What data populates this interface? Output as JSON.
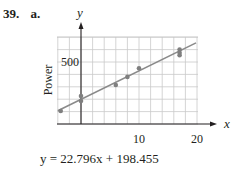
{
  "problem": {
    "number": "39.",
    "part": "a."
  },
  "equation": {
    "text": "y = 22.796x + 198.455"
  },
  "colors": {
    "grid": "#c9c9c9",
    "axis": "#231f20",
    "line": "#8a8a8a",
    "point": "#7f7f7f"
  },
  "chart_data": {
    "type": "scatter",
    "title": "",
    "xlabel": "Force",
    "ylabel": "Power",
    "x_axis_symbol": "x",
    "y_axis_symbol": "y",
    "x_ticks": [
      10,
      20
    ],
    "x_tick_labels": [
      "10",
      "20"
    ],
    "y_ticks": [
      500
    ],
    "y_tick_labels": [
      "500"
    ],
    "xlim": [
      -4,
      20
    ],
    "ylim": [
      0,
      700
    ],
    "grid": true,
    "grid_x_step": 2,
    "grid_y_step": 100,
    "points": [
      {
        "x": -3.5,
        "y": 105
      },
      {
        "x": 0,
        "y": 225
      },
      {
        "x": 0,
        "y": 185
      },
      {
        "x": 6,
        "y": 315
      },
      {
        "x": 8,
        "y": 380
      },
      {
        "x": 10,
        "y": 450
      },
      {
        "x": 17,
        "y": 600
      },
      {
        "x": 17,
        "y": 575
      },
      {
        "x": 17,
        "y": 555
      }
    ],
    "regression": {
      "slope": 22.796,
      "intercept": 198.455,
      "x_range": [
        -4,
        20
      ]
    }
  }
}
